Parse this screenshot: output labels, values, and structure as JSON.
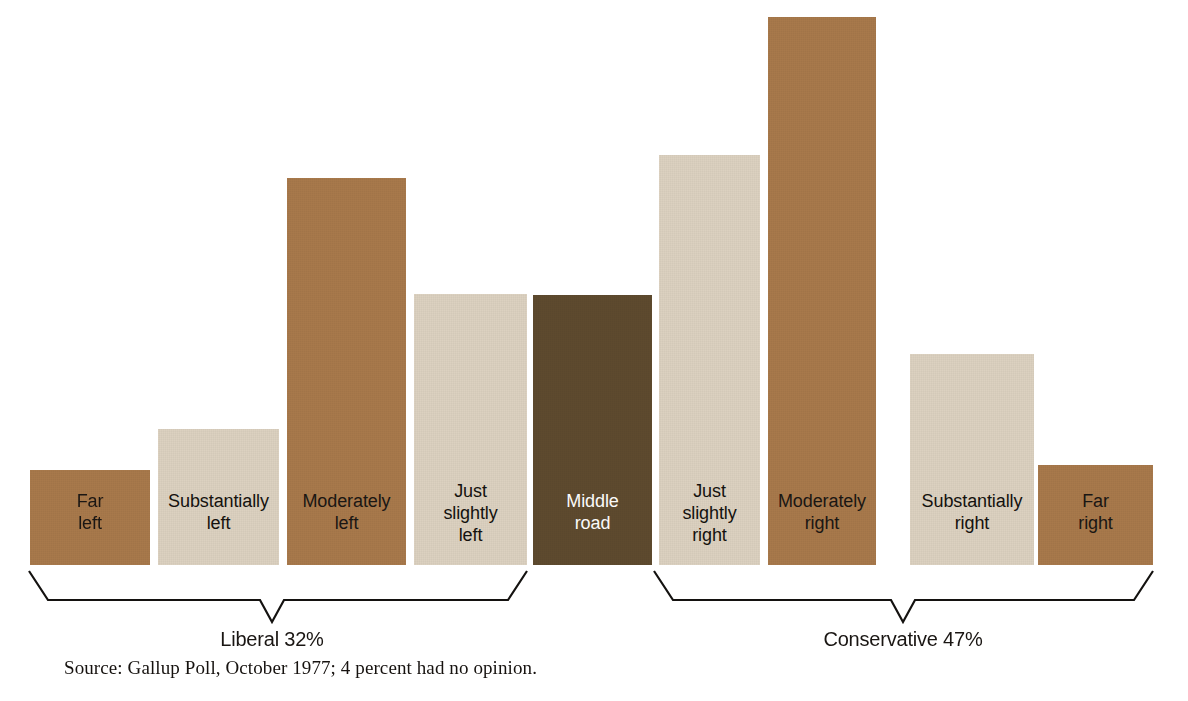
{
  "chart_data": {
    "type": "bar",
    "title": "",
    "subtitle": "",
    "xlabel": "",
    "ylabel": "",
    "grid": false,
    "legend": "none",
    "value_unit": "percent",
    "categories": [
      "Far left",
      "Substantially left",
      "Moderately left",
      "Just slightly left",
      "Middle road",
      "Just slightly right",
      "Moderately right",
      "Substantially right",
      "Far right"
    ],
    "values": [
      4,
      8,
      12,
      9,
      17,
      15,
      20,
      7,
      5
    ],
    "ylim": [
      0,
      22
    ],
    "annotations": [
      "Liberal 32%",
      "Conservative 47%",
      "Source: Gallup Poll, October 1977; 4 percent had no opinion."
    ]
  },
  "colors": {
    "medium_brown": "#A8794B",
    "light_beige": "#DCD1C0",
    "pale_beige": "#E2D9CB",
    "dark_brown": "#5E4A2E",
    "background": "#FFFFFF",
    "ink": "#1A1613",
    "brace_line": "#141210"
  },
  "bars": [
    {
      "id": "far-left",
      "label": "Far\nleft",
      "tone": "medium",
      "x": 30,
      "y": 470,
      "w": 120,
      "h": 95
    },
    {
      "id": "substantially-left",
      "label": "Substantially\nleft",
      "tone": "light",
      "x": 158,
      "y": 429,
      "w": 121,
      "h": 136
    },
    {
      "id": "moderately-left",
      "label": "Moderately\nleft",
      "tone": "medium",
      "x": 287,
      "y": 178,
      "w": 119,
      "h": 387
    },
    {
      "id": "just-slightly-left",
      "label": "Just\nslightly\nleft",
      "tone": "light",
      "x": 414,
      "y": 294,
      "w": 113,
      "h": 271
    },
    {
      "id": "middle-road",
      "label": "Middle\nroad",
      "tone": "dark",
      "x": 533,
      "y": 295,
      "w": 119,
      "h": 270
    },
    {
      "id": "just-slightly-right",
      "label": "Just\nslightly\nright",
      "tone": "light",
      "x": 659,
      "y": 155,
      "w": 101,
      "h": 410
    },
    {
      "id": "moderately-right",
      "label": "Moderately\nright",
      "tone": "medium",
      "x": 768,
      "y": 17,
      "w": 108,
      "h": 548
    },
    {
      "id": "substantially-right",
      "label": "Substantially\nright",
      "tone": "light",
      "x": 910,
      "y": 354,
      "w": 124,
      "h": 211
    },
    {
      "id": "far-right",
      "label": "Far\nright",
      "tone": "medium",
      "x": 1038,
      "y": 465,
      "w": 115,
      "h": 100
    }
  ],
  "bar_label_offsets": [
    30,
    30,
    30,
    18,
    30,
    18,
    30,
    30,
    30
  ],
  "groups": [
    {
      "id": "liberal",
      "label": "Liberal 32%",
      "label_x": 272,
      "label_y": 628,
      "brace": {
        "x1": 29,
        "x2": 527,
        "top": 571,
        "shoulder": 600,
        "apex_x": 272,
        "apex_y": 622
      }
    },
    {
      "id": "conservative",
      "label": "Conservative 47%",
      "label_x": 903,
      "label_y": 628,
      "brace": {
        "x1": 654,
        "x2": 1153,
        "top": 571,
        "shoulder": 600,
        "apex_x": 903,
        "apex_y": 622
      }
    }
  ],
  "source": {
    "note": "Source: Gallup Poll, October 1977; 4 percent had no opinion."
  }
}
